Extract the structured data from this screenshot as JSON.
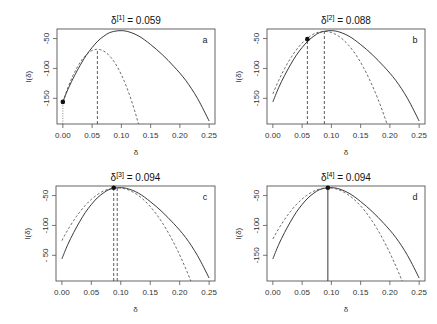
{
  "chart_data": [
    {
      "type": "line",
      "panel_label": "a",
      "title_prefix": "δ",
      "title_superscript": "[1]",
      "title_suffix": " = 0.059",
      "xlabel": "δ",
      "ylabel": "l(δ)",
      "xlim": [
        0,
        0.25
      ],
      "ylim": [
        -193,
        -34
      ],
      "xticks": [
        0.0,
        0.05,
        0.1,
        0.15,
        0.2,
        0.25
      ],
      "xtick_labels": [
        "0.00",
        "0.05",
        "0.10",
        "0.15",
        "0.20",
        "0.25"
      ],
      "yticks": [
        -50,
        -100,
        -150
      ],
      "ytick_labels": [
        "-50",
        "-100",
        "-150"
      ],
      "grid": false,
      "series": [
        {
          "name": "log-likelihood",
          "style": "solid",
          "x": [
            0,
            0.01,
            0.02,
            0.03,
            0.04,
            0.05,
            0.06,
            0.07,
            0.08,
            0.094,
            0.11,
            0.13,
            0.15,
            0.17,
            0.19,
            0.21,
            0.23,
            0.25
          ],
          "y": [
            -156,
            -132,
            -112,
            -94,
            -78,
            -65,
            -54,
            -46,
            -40,
            -37,
            -38,
            -46,
            -60,
            -77,
            -97,
            -120,
            -150,
            -188
          ]
        },
        {
          "name": "quadratic approximation",
          "style": "dashed",
          "center": 0.059,
          "peak": -68,
          "curvature": 25300
        }
      ],
      "current_point": {
        "x": 0.0,
        "y": -156
      },
      "vlines": [
        {
          "x": 0.0,
          "style": "dotted",
          "from": "bottom",
          "to_y": -156
        },
        {
          "x": 0.059,
          "style": "dashed",
          "from": "bottom",
          "to_y": -68
        }
      ]
    },
    {
      "type": "line",
      "panel_label": "b",
      "title_prefix": "δ",
      "title_superscript": "[2]",
      "title_suffix": " = 0.088",
      "xlabel": "δ",
      "ylabel": "l(δ)",
      "xlim": [
        0,
        0.25
      ],
      "ylim": [
        -193,
        -34
      ],
      "xticks": [
        0.0,
        0.05,
        0.1,
        0.15,
        0.2,
        0.25
      ],
      "xtick_labels": [
        "0.00",
        "0.05",
        "0.10",
        "0.15",
        "0.20",
        "0.25"
      ],
      "yticks": [
        -50,
        -100,
        -150
      ],
      "ytick_labels": [
        "-50",
        "-100",
        "-150"
      ],
      "grid": false,
      "series": [
        {
          "name": "log-likelihood",
          "style": "solid",
          "x": [
            0,
            0.01,
            0.02,
            0.03,
            0.04,
            0.05,
            0.06,
            0.07,
            0.08,
            0.094,
            0.11,
            0.13,
            0.15,
            0.17,
            0.19,
            0.21,
            0.23,
            0.25
          ],
          "y": [
            -156,
            -132,
            -112,
            -94,
            -78,
            -65,
            -54,
            -46,
            -40,
            -37,
            -38,
            -46,
            -60,
            -77,
            -97,
            -120,
            -150,
            -188
          ]
        },
        {
          "name": "quadratic approximation",
          "style": "dashed",
          "center": 0.088,
          "peak": -38,
          "curvature": 13500
        }
      ],
      "current_point": {
        "x": 0.059,
        "y": -51
      },
      "vlines": [
        {
          "x": 0.059,
          "style": "dashed",
          "from": "bottom",
          "to_y": -51
        },
        {
          "x": 0.088,
          "style": "dashed",
          "from": "bottom",
          "to_y": -38
        }
      ]
    },
    {
      "type": "line",
      "panel_label": "c",
      "title_prefix": "δ",
      "title_superscript": "[3]",
      "title_suffix": " = 0.094",
      "xlabel": "δ",
      "ylabel": "l(δ)",
      "xlim": [
        0,
        0.25
      ],
      "ylim": [
        -193,
        -34
      ],
      "xticks": [
        0.0,
        0.05,
        0.1,
        0.15,
        0.2,
        0.25
      ],
      "xtick_labels": [
        "0.00",
        "0.05",
        "0.10",
        "0.15",
        "0.20",
        "0.25"
      ],
      "yticks": [
        -50,
        -100,
        -150
      ],
      "ytick_labels": [
        "-50",
        "-100",
        "- 50"
      ],
      "grid": false,
      "series": [
        {
          "name": "log-likelihood",
          "style": "solid",
          "x": [
            0,
            0.01,
            0.02,
            0.03,
            0.04,
            0.05,
            0.06,
            0.07,
            0.08,
            0.094,
            0.11,
            0.13,
            0.15,
            0.17,
            0.19,
            0.21,
            0.23,
            0.25
          ],
          "y": [
            -156,
            -132,
            -112,
            -94,
            -78,
            -65,
            -54,
            -46,
            -40,
            -37,
            -38,
            -46,
            -60,
            -77,
            -97,
            -120,
            -150,
            -188
          ]
        },
        {
          "name": "quadratic approximation",
          "style": "dashed",
          "center": 0.094,
          "peak": -37,
          "curvature": 10000
        }
      ],
      "current_point": {
        "x": 0.088,
        "y": -37
      },
      "vlines": [
        {
          "x": 0.088,
          "style": "dashed",
          "from": "bottom",
          "to_y": -37
        },
        {
          "x": 0.094,
          "style": "dashed",
          "from": "bottom",
          "to_y": -37
        }
      ]
    },
    {
      "type": "line",
      "panel_label": "d",
      "title_prefix": "δ",
      "title_superscript": "[4]",
      "title_suffix": " = 0.094",
      "xlabel": "δ",
      "ylabel": "l(δ)",
      "xlim": [
        0,
        0.25
      ],
      "ylim": [
        -193,
        -34
      ],
      "xticks": [
        0.0,
        0.05,
        0.1,
        0.15,
        0.2,
        0.25
      ],
      "xtick_labels": [
        "0.00",
        "0.05",
        "0.10",
        "0.15",
        "0.20",
        "0.25"
      ],
      "yticks": [
        -50,
        -100,
        -150
      ],
      "ytick_labels": [
        "-50",
        "-100",
        "-150"
      ],
      "grid": false,
      "series": [
        {
          "name": "log-likelihood",
          "style": "solid",
          "x": [
            0,
            0.01,
            0.02,
            0.03,
            0.04,
            0.05,
            0.06,
            0.07,
            0.08,
            0.094,
            0.11,
            0.13,
            0.15,
            0.17,
            0.19,
            0.21,
            0.23,
            0.25
          ],
          "y": [
            -156,
            -132,
            -112,
            -94,
            -78,
            -65,
            -54,
            -46,
            -40,
            -37,
            -38,
            -46,
            -60,
            -77,
            -97,
            -120,
            -150,
            -188
          ]
        },
        {
          "name": "quadratic approximation",
          "style": "dashed",
          "center": 0.094,
          "peak": -37,
          "curvature": 9700
        }
      ],
      "current_point": {
        "x": 0.094,
        "y": -37
      },
      "vlines": [
        {
          "x": 0.094,
          "style": "solid",
          "from": "bottom",
          "to_y": -37
        }
      ]
    }
  ]
}
